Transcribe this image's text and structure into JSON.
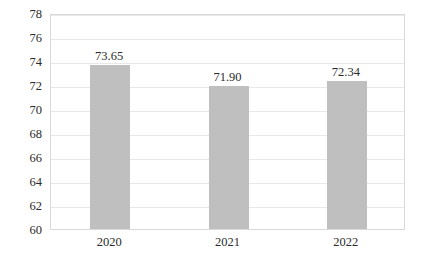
{
  "chart_data": {
    "type": "bar",
    "title": "",
    "subtitle": "",
    "xlabel": "",
    "ylabel": "",
    "categories": [
      "2020",
      "2021",
      "2022"
    ],
    "values": [
      73.65,
      71.9,
      72.34
    ],
    "data_labels": [
      "73.65",
      "71.90",
      "72.34"
    ],
    "series": [
      {
        "name": "",
        "values": [
          73.65,
          71.9,
          72.34
        ],
        "color": "#bfbfbf"
      }
    ],
    "ylim": [
      60,
      78
    ],
    "ytick_values": [
      78,
      76,
      74,
      72,
      70,
      68,
      66,
      64,
      62,
      60
    ],
    "ytick_labels": [
      "78",
      "76",
      "74",
      "72",
      "70",
      "68",
      "66",
      "64",
      "62",
      "60"
    ],
    "grid": true,
    "grid_axis": "y",
    "legend": false,
    "legend_position": "none",
    "annotations": [],
    "colors": {
      "bar_fill": "#bfbfbf",
      "gridline": "#e8e8e8",
      "plot_border": "#d9d9d9",
      "text": "#2b2b2b",
      "background": "#ffffff"
    }
  }
}
